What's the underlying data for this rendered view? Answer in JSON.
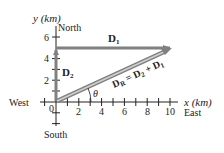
{
  "diagram": {
    "type": "vector-addition",
    "axes": {
      "x_label": "x (km)",
      "y_label": "y (km)",
      "x_direction": "East",
      "neg_x_direction": "West",
      "y_direction": "North",
      "neg_y_direction": "South",
      "origin_label": "0",
      "x_ticks": [
        "2",
        "4",
        "6",
        "8",
        "10"
      ],
      "y_ticks": [
        "2",
        "4",
        "6"
      ]
    },
    "vectors": [
      {
        "name": "D1",
        "label_main": "D",
        "label_sub": "1",
        "from": [
          0,
          5
        ],
        "to": [
          10,
          5
        ]
      },
      {
        "name": "D2",
        "label_main": "D",
        "label_sub": "2",
        "from": [
          0,
          0
        ],
        "to": [
          0,
          5
        ]
      },
      {
        "name": "DR",
        "label_main": "D",
        "label_sub": "R",
        "equation_rest": " = D",
        "eq_sub1": "2",
        "eq_plus": " + D",
        "eq_sub2": "1",
        "from": [
          0,
          0
        ],
        "to": [
          10,
          5
        ]
      }
    ],
    "angle_label": "θ",
    "colors": {
      "vector": "#808080",
      "axis": "#222222",
      "text": "#222222"
    }
  }
}
